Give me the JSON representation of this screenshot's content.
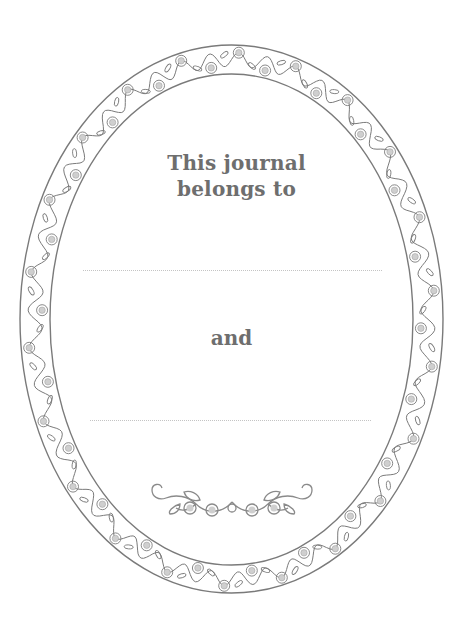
{
  "page": {
    "title_line1": "This journal",
    "title_line2": "belongs to",
    "connector": "and"
  },
  "fields": [
    {
      "name": "owner-1",
      "value": ""
    },
    {
      "name": "owner-2",
      "value": ""
    }
  ],
  "decorations": {
    "frame": "oval-floral-vine-border-icon",
    "ornament": "floral-divider-icon"
  },
  "colors": {
    "text": "#6e6e6e",
    "line": "#7a7a7a",
    "flower_fill": "#cfcfcf",
    "dotted_line": "#c4c4c4",
    "background": "#ffffff"
  }
}
